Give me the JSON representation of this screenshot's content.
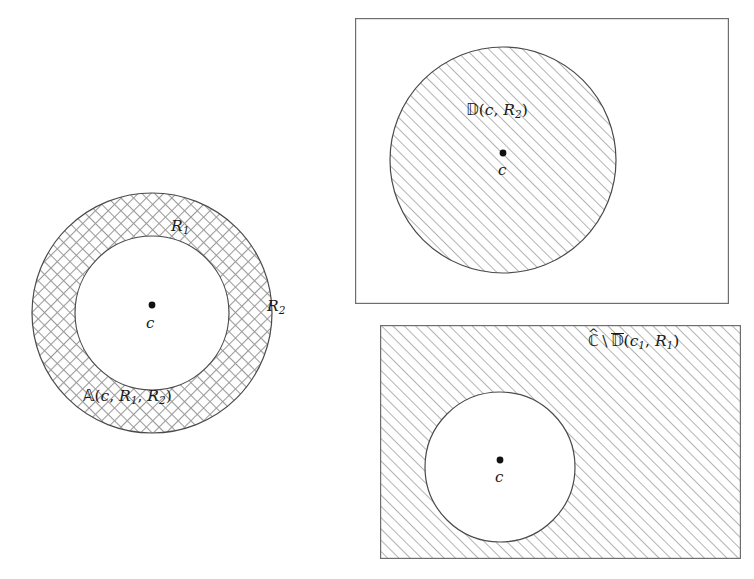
{
  "figure": {
    "width": 754,
    "height": 579,
    "background_color": "#ffffff",
    "stroke_color": "#4a4a4a",
    "hatch_color": "#9a9a9a",
    "text_color": "#1a1a1a"
  },
  "panels": {
    "annulus": {
      "name": "annulus-panel",
      "center": {
        "x": 152,
        "y": 313
      },
      "outer_radius": 120,
      "inner_radius": 77,
      "fill_pattern": "crosshatch",
      "labels": {
        "region": {
          "symbol": "A",
          "open": "(",
          "arg1": "c",
          "comma1": ", ",
          "arg2": "R",
          "sub2": "1",
          "comma2": ", ",
          "arg3": "R",
          "sub3": "2",
          "close": ")"
        },
        "inner_radius_label": {
          "base": "R",
          "sub": "1"
        },
        "outer_radius_label": {
          "base": "R",
          "sub": "2"
        },
        "center_label": "c"
      }
    },
    "disk": {
      "name": "disk-panel",
      "frame": {
        "x": 355,
        "y": 18,
        "width": 373,
        "height": 285
      },
      "circle": {
        "cx": 503,
        "cy": 160,
        "r": 113
      },
      "fill_pattern": "diagonal-hatch",
      "labels": {
        "region": {
          "symbol": "D",
          "open": "(",
          "arg1": "c",
          "comma1": ", ",
          "arg2": "R",
          "sub2": "2",
          "close": ")"
        },
        "center_label": "c"
      }
    },
    "complement": {
      "name": "complement-panel",
      "frame": {
        "x": 380,
        "y": 325,
        "width": 360,
        "height": 233
      },
      "circle": {
        "cx": 500,
        "cy": 467,
        "r": 75
      },
      "fill_pattern": "diagonal-hatch",
      "labels": {
        "region": {
          "symbol_c": "C",
          "hat": "^",
          "setminus": "\\",
          "symbol_d": "D",
          "open": "(",
          "arg1": "c",
          "sub1": "1",
          "comma1": ", ",
          "arg2": "R",
          "sub2": "1",
          "close": ")"
        },
        "center_label": "c"
      }
    }
  }
}
